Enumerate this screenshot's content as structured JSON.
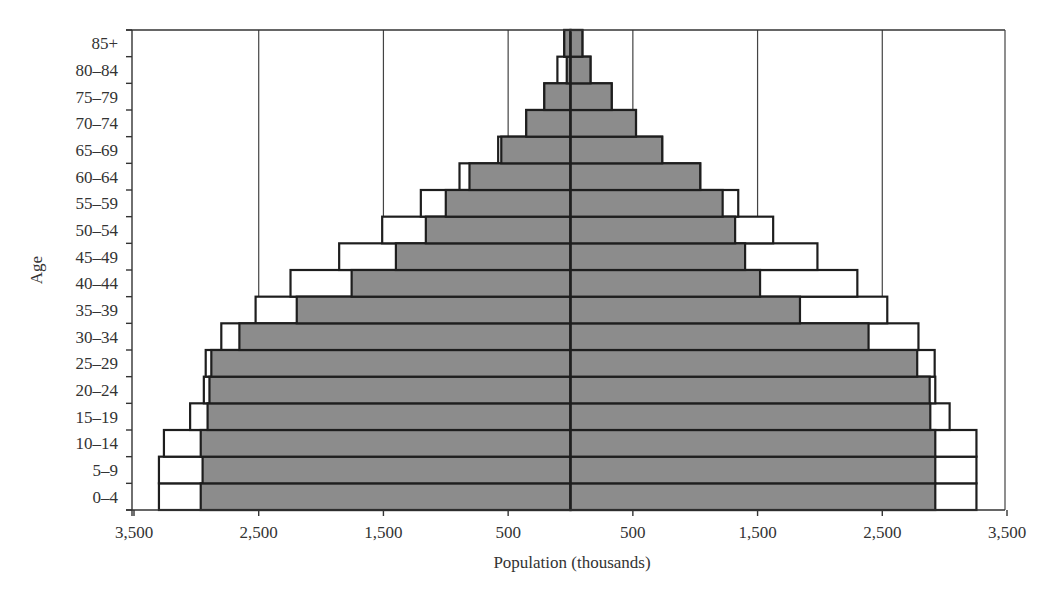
{
  "chart_data": {
    "type": "bar",
    "orientation": "horizontal",
    "subtype": "population-pyramid",
    "title": "",
    "xlabel": "Population (thousands)",
    "ylabel": "Age",
    "categories": [
      "0–4",
      "5–9",
      "10–14",
      "15–19",
      "20–24",
      "25–29",
      "30–34",
      "35–39",
      "40–44",
      "45–49",
      "50–54",
      "55–59",
      "60–64",
      "65–69",
      "70–74",
      "75–79",
      "80–84",
      "85+"
    ],
    "x_ticks": [
      {
        "value": -3500,
        "label": "3,500"
      },
      {
        "value": -2500,
        "label": "2,500"
      },
      {
        "value": -1500,
        "label": "1,500"
      },
      {
        "value": -500,
        "label": "500"
      },
      {
        "value": 500,
        "label": "500"
      },
      {
        "value": 1500,
        "label": "1,500"
      },
      {
        "value": 2500,
        "label": "2,500"
      },
      {
        "value": 3500,
        "label": "3,500"
      }
    ],
    "xlim": [
      -3500,
      3500
    ],
    "grid": {
      "vertical": true,
      "horizontal": false
    },
    "legend": null,
    "series": [
      {
        "name": "Left side (outline, white)",
        "side": "left",
        "fill": "#ffffff",
        "values": [
          3300,
          3300,
          3260,
          3050,
          2940,
          2925,
          2800,
          2525,
          2245,
          1855,
          1510,
          1200,
          890,
          580,
          355,
          210,
          105,
          50
        ]
      },
      {
        "name": "Left side (shaded, gray)",
        "side": "left",
        "fill": "#8c8c8c",
        "values": [
          2965,
          2950,
          2965,
          2910,
          2895,
          2880,
          2655,
          2195,
          1755,
          1400,
          1160,
          1000,
          810,
          555,
          355,
          210,
          30,
          50
        ]
      },
      {
        "name": "Right side (outline, white)",
        "side": "right",
        "fill": "#ffffff",
        "values": [
          3255,
          3255,
          3255,
          3040,
          2925,
          2920,
          2790,
          2540,
          2300,
          1980,
          1625,
          1345,
          1040,
          735,
          525,
          330,
          160,
          95
        ]
      },
      {
        "name": "Right side (shaded, gray)",
        "side": "right",
        "fill": "#8c8c8c",
        "values": [
          2925,
          2925,
          2925,
          2885,
          2880,
          2780,
          2390,
          1840,
          1520,
          1400,
          1320,
          1220,
          1040,
          735,
          525,
          330,
          160,
          95
        ]
      }
    ]
  },
  "colors": {
    "shaded_fill": "#8c8c8c",
    "outline_fill": "#ffffff",
    "stroke": "#1e1e1e",
    "gridline": "#444444"
  }
}
